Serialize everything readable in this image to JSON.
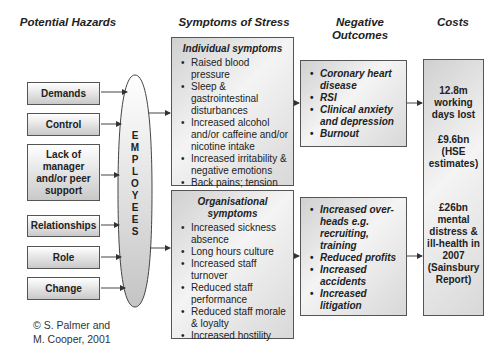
{
  "columns": {
    "hazards": "Potential Hazards",
    "symptoms": "Symptoms of Stress",
    "outcomes_line1": "Negative",
    "outcomes_line2": "Outcomes",
    "costs": "Costs"
  },
  "hazards": [
    {
      "label": "Demands"
    },
    {
      "label": "Control"
    },
    {
      "label": "Lack of manager and/or peer support"
    },
    {
      "label": "Relationships"
    },
    {
      "label": "Role"
    },
    {
      "label": "Change"
    }
  ],
  "employees_letters": [
    "E",
    "M",
    "P",
    "L",
    "O",
    "Y",
    "E",
    "E",
    "S"
  ],
  "individual": {
    "title": "Individual symptoms",
    "items": [
      "Raised blood pressure",
      "Sleep & gastrointestinal disturbances",
      "Increased alcohol and/or caffeine and/or nicotine intake",
      "Increased irritability & negative emotions",
      "Back pains; tension",
      "Palpitations; headaches"
    ]
  },
  "organisational": {
    "title": "Organisational symptoms",
    "items": [
      "Increased sickness absence",
      "Long hours culture",
      "Increased staff turnover",
      "Reduced staff performance",
      "Reduced staff morale & loyalty",
      "Increased hostility"
    ]
  },
  "outcomes_individual": [
    "Coronary heart disease",
    "RSI",
    "Clinical anxiety and depression",
    "Burnout"
  ],
  "outcomes_organisational": [
    "Increased over-heads e.g. recruiting, training",
    "Reduced profits",
    "Increased accidents",
    "Increased litigation"
  ],
  "costs": {
    "top_1": "12.8m working days lost",
    "top_2": "£9.6bn (HSE estimates)",
    "bottom": "£26bn mental distress & ill-health in 2007 (Sainsbury Report)"
  },
  "credit": {
    "line1": "© S. Palmer and",
    "line2": "M. Cooper, 2001"
  }
}
